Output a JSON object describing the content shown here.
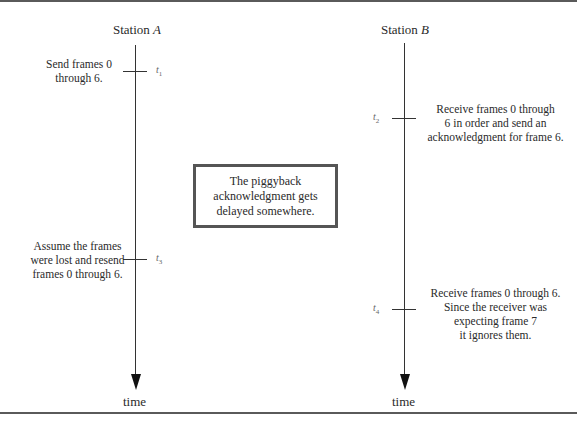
{
  "stations": {
    "a": {
      "prefix": "Station ",
      "name": "A",
      "time_label": "time"
    },
    "b": {
      "prefix": "Station ",
      "name": "B",
      "time_label": "time"
    }
  },
  "events": [
    {
      "t": "t",
      "sub": "1",
      "station": "A",
      "lines": [
        "Send frames 0",
        "through 6."
      ]
    },
    {
      "t": "t",
      "sub": "2",
      "station": "B",
      "lines": [
        "Receive frames 0 through",
        "6 in order and send an",
        "acknowledgment for frame 6."
      ]
    },
    {
      "t": "t",
      "sub": "3",
      "station": "A",
      "lines": [
        "Assume the frames",
        "were lost and resend",
        "frames 0 through 6."
      ]
    },
    {
      "t": "t",
      "sub": "4",
      "station": "B",
      "lines": [
        "Receive frames 0 through 6.",
        "Since the receiver was",
        "expecting frame 7",
        "it ignores them."
      ]
    }
  ],
  "callout": {
    "lines": [
      "The piggyback",
      "acknowledgment gets",
      "delayed somewhere."
    ]
  }
}
